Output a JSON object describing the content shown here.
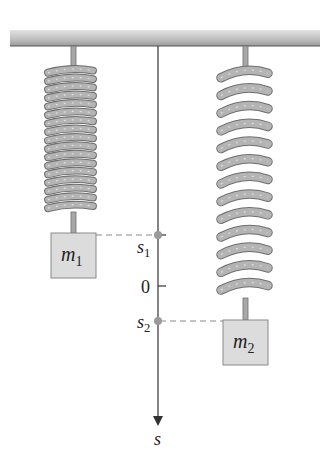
{
  "figure": {
    "colors": {
      "ceiling_light": "#d8d8d8",
      "ceiling_dark": "#8a8a8a",
      "spring": "#a8a8a8",
      "spring_outline": "#6e6e6e",
      "mass_fill": "#dcdcdc",
      "mass_outline": "#8a8a8a",
      "axis": "#333333",
      "marker": "#9a9a9a",
      "dash": "#888888"
    },
    "axis": {
      "label": "s",
      "ticks": [
        {
          "label": "s",
          "sub": "1",
          "kind": "marker"
        },
        {
          "label": "0",
          "kind": "tick"
        },
        {
          "label": "s",
          "sub": "2",
          "kind": "marker"
        }
      ]
    },
    "masses": [
      {
        "name": "m",
        "sub": "1",
        "spring": "short, compressed coils"
      },
      {
        "name": "m",
        "sub": "2",
        "spring": "long, stretched coils"
      }
    ]
  }
}
